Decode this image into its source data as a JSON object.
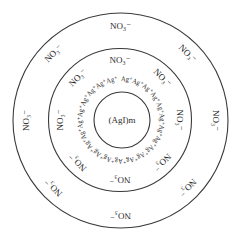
{
  "diagram": {
    "core_label": "(AgI)m",
    "adsorbed_ion_label": "Ag⁺",
    "adsorbed_ion_count": 22,
    "inner_counter_ion_label": "NO₃⁻",
    "inner_counter_ion_count": 8,
    "outer_counter_ion_label": "NO₃⁻",
    "outer_counter_ion_count": 8,
    "layers": [
      "core",
      "adsorbed Ag+ layer",
      "adsorption layer NO3-",
      "diffusion layer NO3-"
    ],
    "line_color": "#3a3a3a",
    "text_color": "#2a2a2a"
  }
}
